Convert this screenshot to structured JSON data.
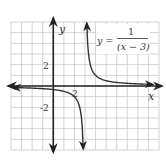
{
  "chart_data": {
    "type": "line",
    "title": "",
    "function": "y = 1/(x - 3)",
    "equation_label": {
      "lhs": "y =",
      "numerator": "1",
      "denominator": "(x − 3)"
    },
    "xlabel": "x",
    "ylabel": "y",
    "xlim": [
      -4,
      10
    ],
    "ylim": [
      -6,
      6
    ],
    "grid": true,
    "grid_step": 1,
    "x_tick_labels": [
      {
        "value": 2,
        "label": "2"
      }
    ],
    "y_tick_labels": [
      {
        "value": 2,
        "label": "2"
      },
      {
        "value": -2,
        "label": "-2"
      }
    ],
    "vertical_asymptote": 3,
    "horizontal_asymptote": 0,
    "series": [
      {
        "name": "left-branch",
        "x_range": [
          -3.8,
          2.83
        ]
      },
      {
        "name": "right-branch",
        "x_range": [
          3.17,
          9.4
        ]
      }
    ],
    "legend": "top-right"
  }
}
